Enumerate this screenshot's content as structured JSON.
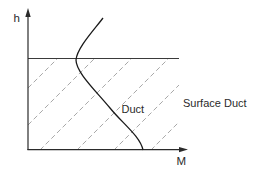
{
  "diagram": {
    "axes": {
      "y_label": "h",
      "x_label": "M"
    },
    "labels": {
      "duct": "Duct",
      "surface_duct": "Surface Duct"
    },
    "colors": {
      "axis": "#2a2a2a",
      "profile_curve": "#1a1a1a",
      "hatch": "#a8a8a8",
      "background": "#ffffff"
    },
    "profile_curve": {
      "description": "M-profile: decreasing M with height below duct top (trapping layer), increasing above",
      "path": "M103,18 C94,30 77,48 76,60 C76,72 95,90 110,108 C122,123 140,136 143,150"
    },
    "duct_top_line": {
      "x1": 28,
      "y1": 58.5,
      "x2": 179,
      "y2": 58.5
    },
    "hatch_region": "surface duct (from ground to duct top)",
    "hatch_lines": [
      {
        "x1": 28,
        "y1": 88,
        "x2": 58,
        "y2": 58
      },
      {
        "x1": 28,
        "y1": 125,
        "x2": 95,
        "y2": 58
      },
      {
        "x1": 40,
        "y1": 150,
        "x2": 132,
        "y2": 58
      },
      {
        "x1": 77,
        "y1": 150,
        "x2": 169,
        "y2": 58
      },
      {
        "x1": 114,
        "y1": 150,
        "x2": 179,
        "y2": 85
      },
      {
        "x1": 151,
        "y1": 150,
        "x2": 179,
        "y2": 122
      }
    ]
  }
}
